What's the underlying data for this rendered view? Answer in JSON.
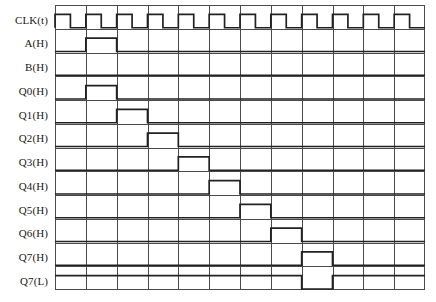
{
  "figure": {
    "type": "digital-timing-diagram",
    "title": "",
    "background_color": "#ffffff",
    "line_color": "#222222",
    "grid_color": "#4a4a4a",
    "width_px": 436,
    "height_px": 302
  },
  "axis": {
    "columns": 12,
    "column_labels": [],
    "grid_vertical": true,
    "grid_horizontal_baselines": true
  },
  "signals": [
    {
      "name": "CLK(t)",
      "label": "CLK(t)",
      "row": 0,
      "kind": "clock",
      "description": "Free-running clock, 12 pulses, rising edge at each column boundary",
      "pulses": [
        0,
        1,
        2,
        3,
        4,
        5,
        6,
        7,
        8,
        9,
        10,
        11
      ],
      "duty": 0.5,
      "level": "low"
    },
    {
      "name": "A(H)",
      "label": "A(H)",
      "row": 1,
      "kind": "pulse",
      "description": "Single active-high pulse during column 1",
      "pulses": [
        1
      ],
      "level": "low"
    },
    {
      "name": "B(H)",
      "label": "B(H)",
      "row": 2,
      "kind": "static",
      "description": "Held low for entire sequence",
      "pulses": [],
      "level": "low"
    },
    {
      "name": "Q0(H)",
      "label": "Q0(H)",
      "row": 3,
      "kind": "pulse",
      "description": "Active-high for one clock period at column 1",
      "pulses": [
        1
      ],
      "level": "low"
    },
    {
      "name": "Q1(H)",
      "label": "Q1(H)",
      "row": 4,
      "kind": "pulse",
      "description": "Active-high for one clock period at column 2",
      "pulses": [
        2
      ],
      "level": "low"
    },
    {
      "name": "Q2(H)",
      "label": "Q2(H)",
      "row": 5,
      "kind": "pulse",
      "description": "Active-high for one clock period at column 3",
      "pulses": [
        3
      ],
      "level": "low"
    },
    {
      "name": "Q3(H)",
      "label": "Q3(H)",
      "row": 6,
      "kind": "pulse",
      "description": "Active-high for one clock period at column 4",
      "pulses": [
        4
      ],
      "level": "low"
    },
    {
      "name": "Q4(H)",
      "label": "Q4(H)",
      "row": 7,
      "kind": "pulse",
      "description": "Active-high for one clock period at column 5",
      "pulses": [
        5
      ],
      "level": "low"
    },
    {
      "name": "Q5(H)",
      "label": "Q5(H)",
      "row": 8,
      "kind": "pulse",
      "description": "Active-high for one clock period at column 6",
      "pulses": [
        6
      ],
      "level": "low"
    },
    {
      "name": "Q6(H)",
      "label": "Q6(H)",
      "row": 9,
      "kind": "pulse",
      "description": "Active-high for one clock period at column 7",
      "pulses": [
        7
      ],
      "level": "low"
    },
    {
      "name": "Q7(H)",
      "label": "Q7(H)",
      "row": 10,
      "kind": "pulse",
      "description": "Active-high for one clock period at column 8",
      "pulses": [
        8
      ],
      "level": "low"
    },
    {
      "name": "Q7(L)",
      "label": "Q7(L)",
      "row": 11,
      "kind": "pulse-inverted",
      "description": "Complement of Q7(H); shown as block at column 8",
      "pulses": [
        8
      ],
      "level": "low"
    }
  ]
}
